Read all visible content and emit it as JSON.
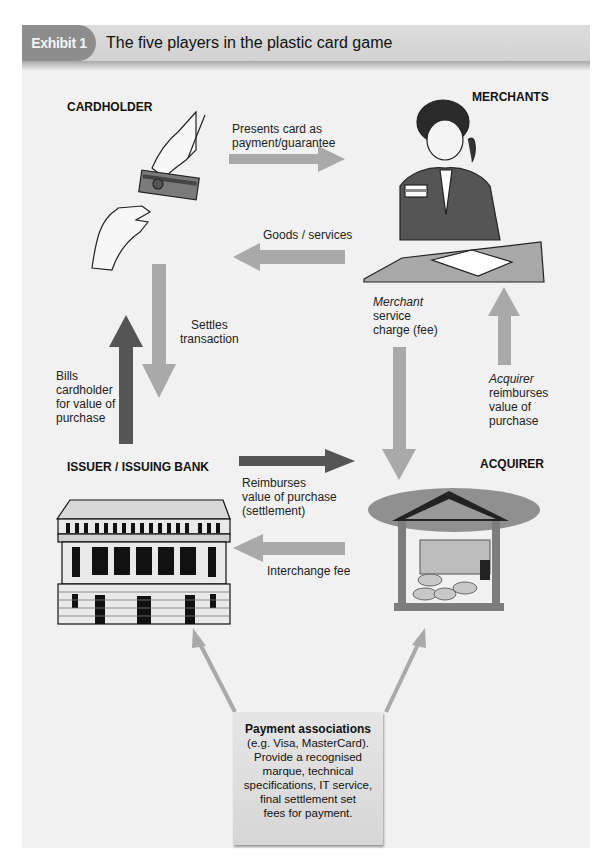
{
  "header": {
    "exhibit_label": "Exhibit 1",
    "title": "The five players in the plastic card game"
  },
  "players": {
    "cardholder": "CARDHOLDER",
    "merchants": "MERCHANTS",
    "issuer": "ISSUER / ISSUING BANK",
    "acquirer": "ACQUIRER"
  },
  "flows": {
    "presents_card": {
      "line1": "Presents card as",
      "line2": "payment/guarantee"
    },
    "goods_services": "Goods / services",
    "settles": {
      "line1": "Settles",
      "line2": "transaction"
    },
    "bills": {
      "line1": "Bills",
      "line2": "cardholder",
      "line3": "for value of",
      "line4": "purchase"
    },
    "merchant_fee": {
      "italic": "Merchant",
      "line2": "service",
      "line3": "charge (fee)"
    },
    "acquirer_reimburses": {
      "italic": "Acquirer",
      "line2": "reimburses",
      "line3": "value of",
      "line4": "purchase"
    },
    "reimburses_settlement": {
      "line1": "Reimburses",
      "line2": "value of purchase",
      "line3": "(settlement)"
    },
    "interchange": "Interchange fee"
  },
  "payment_associations": {
    "title": "Payment associations",
    "lines": [
      "(e.g. Visa, MasterCard).",
      "Provide a recognised",
      "marque, technical",
      "specifications, IT service,",
      "final settlement set",
      "fees for payment."
    ]
  },
  "colors": {
    "panel_bg": "#f1f1f1",
    "header_bg": "#d6d6d6",
    "exhibit_tab": "#8d8d8d",
    "light_arrow": "#a9a9a9",
    "dark_arrow": "#555555"
  },
  "icons": [
    "hands-card-illustration",
    "merchant-phone-illustration",
    "bank-building-illustration",
    "acquirer-money-illustration"
  ]
}
